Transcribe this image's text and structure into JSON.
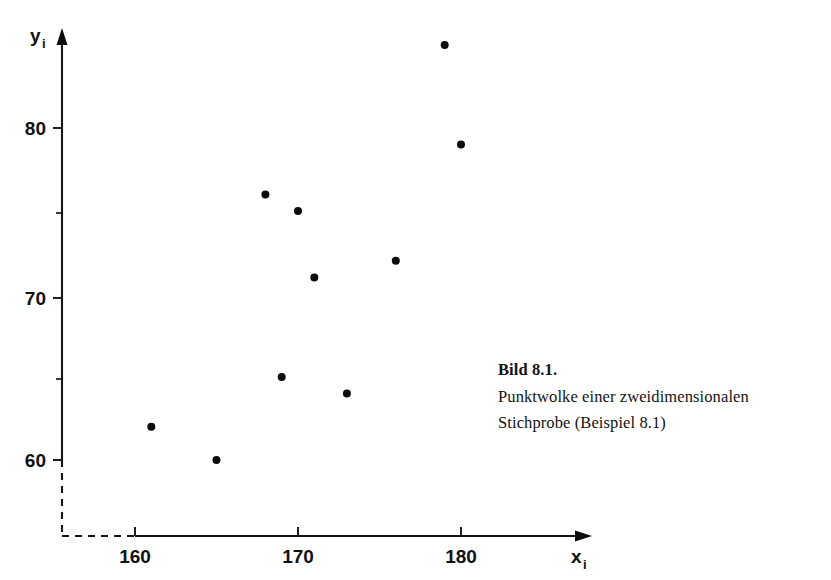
{
  "figure": {
    "caption_title": "Bild 8.1.",
    "caption_line_1": "Punktwolke einer zweidimensionalen",
    "caption_line_2": "Stichprobe (Beispiel 8.1)",
    "ink_color": "#111111",
    "background_color": "#ffffff"
  },
  "axes": {
    "x_axis_name": "x",
    "x_axis_subscript": "i",
    "y_axis_name": "y",
    "y_axis_subscript": "i",
    "x_ticks": [
      "160",
      "170",
      "180"
    ],
    "y_ticks": [
      "80",
      "70",
      "60"
    ],
    "break_indicator": "dashed-origin-break"
  },
  "chart_data": {
    "type": "scatter",
    "title": "Punktwolke einer zweidimensionalen Stichprobe (Beispiel 8.1)",
    "xlabel": "x_i",
    "ylabel": "y_i",
    "xlim": [
      156.5,
      183.5
    ],
    "ylim": [
      57.5,
      86.5
    ],
    "xticks": [
      160,
      170,
      180
    ],
    "yticks": [
      60,
      70,
      80
    ],
    "y_minor_ticks": [
      65,
      75
    ],
    "grid": false,
    "legend": false,
    "points": [
      {
        "x": 161,
        "y": 62
      },
      {
        "x": 165,
        "y": 60
      },
      {
        "x": 168,
        "y": 76
      },
      {
        "x": 169,
        "y": 65
      },
      {
        "x": 170,
        "y": 75
      },
      {
        "x": 171,
        "y": 71
      },
      {
        "x": 173,
        "y": 64
      },
      {
        "x": 176,
        "y": 72
      },
      {
        "x": 179,
        "y": 85
      },
      {
        "x": 180,
        "y": 79
      }
    ],
    "x": [
      161,
      165,
      168,
      169,
      170,
      171,
      173,
      176,
      179,
      180
    ],
    "values": [
      62,
      60,
      76,
      65,
      75,
      71,
      64,
      72,
      85,
      79
    ]
  }
}
